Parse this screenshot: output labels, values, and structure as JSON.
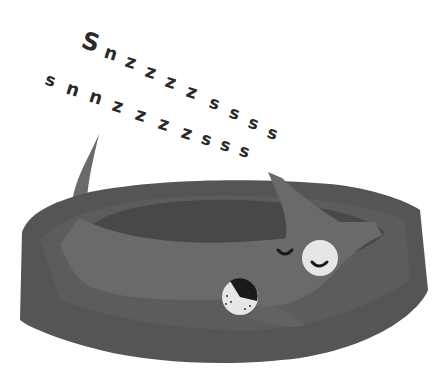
{
  "illustration": {
    "subject": "sleeping dog in a pet bed",
    "snore_text": {
      "line1": [
        "S",
        "n",
        "z",
        "z",
        "z",
        "z",
        "s",
        "s",
        "s",
        "s"
      ],
      "line2": [
        "s",
        "n",
        "n",
        "z",
        "z",
        "z",
        "z",
        "s",
        "s",
        "s",
        "s"
      ]
    },
    "colors": {
      "background": "#ffffff",
      "text": "#2a2a2a",
      "bed_outer": "#555555",
      "bed_inner": "#4a4a4a",
      "bed_rim": "#5e5e5e",
      "dog": "#6a6a6a",
      "dog_shadow": "#606060",
      "eye_patch": "#e6e6e6",
      "nose_dark": "#1a1a1a"
    }
  }
}
